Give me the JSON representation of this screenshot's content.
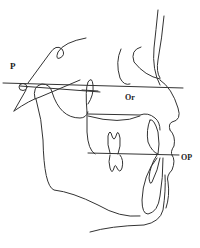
{
  "figure": {
    "type": "cephalometric tracing (lateral skull, soft tissue profile)",
    "labels": {
      "porion": "P",
      "orbitale": "Or",
      "occlusal_plane": "OP"
    },
    "lines": {
      "frankfort_horizontal": "P–Or reference line",
      "occlusal_plane": "OP line through molars and incisors"
    },
    "caption": ""
  },
  "colors": {
    "line": "#333333",
    "background": "#ffffff",
    "text": "#222222"
  }
}
